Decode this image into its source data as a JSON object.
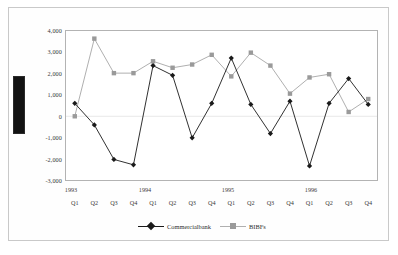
{
  "chart_data": {
    "type": "line",
    "title": "",
    "xlabel": "",
    "ylabel": "",
    "ylim": [
      -3000,
      4000
    ],
    "grid": false,
    "legend_position": "bottom",
    "categories": [
      "1993 Q1",
      "Q2",
      "Q3",
      "Q4",
      "1994 Q1",
      "Q2",
      "Q3",
      "Q4",
      "1995 Q1",
      "Q2",
      "Q3",
      "Q4",
      "1996 Q1",
      "Q2",
      "Q3",
      "Q4"
    ],
    "year_labels": [
      "1993",
      "1994",
      "1995",
      "1996"
    ],
    "quarter_labels": [
      "Q1",
      "Q2",
      "Q3",
      "Q4",
      "Q1",
      "Q2",
      "Q3",
      "Q4",
      "Q1",
      "Q2",
      "Q3",
      "Q4",
      "Q1",
      "Q2",
      "Q3",
      "Q4"
    ],
    "ytick_labels": [
      "4,000",
      "3,000",
      "2,000",
      "1,000",
      "0",
      "-1,000",
      "-2,000",
      "-3,000"
    ],
    "ytick_values": [
      4000,
      3000,
      2000,
      1000,
      0,
      -1000,
      -2000,
      -3000
    ],
    "series": [
      {
        "name": "Commercialbank",
        "color": "#1a1a1a",
        "marker": "diamond",
        "values": [
          600,
          -400,
          -2000,
          -2250,
          2350,
          1900,
          -1000,
          600,
          2700,
          550,
          -800,
          700,
          -2300,
          600,
          1750,
          550
        ]
      },
      {
        "name": "BIBFs",
        "color": "#9a9a9a",
        "marker": "square",
        "values": [
          0,
          3600,
          2000,
          2000,
          2550,
          2250,
          2400,
          2850,
          1850,
          2950,
          2350,
          1050,
          1800,
          1950,
          200,
          800
        ]
      }
    ]
  },
  "legend": {
    "entries": [
      {
        "label": "Commercialbank"
      },
      {
        "label": "BIBFs"
      }
    ]
  },
  "redaction": {
    "name": "redacted-axis-title"
  }
}
